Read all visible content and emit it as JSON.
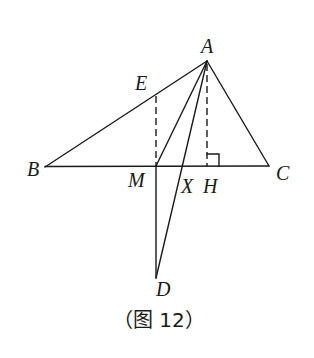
{
  "figure": {
    "caption": "（图 12）",
    "colors": {
      "line": "#1a1a1a",
      "background": "#ffffff"
    },
    "points": {
      "A": {
        "label": "A",
        "x": 207,
        "y": 61
      },
      "B": {
        "label": "B",
        "x": 45,
        "y": 167
      },
      "C": {
        "label": "C",
        "x": 269,
        "y": 166
      },
      "E": {
        "label": "E",
        "x": 156,
        "y": 95
      },
      "M": {
        "label": "M",
        "x": 156,
        "y": 166
      },
      "X": {
        "label": "X",
        "x": 183,
        "y": 166
      },
      "H": {
        "label": "H",
        "x": 207,
        "y": 166
      },
      "D": {
        "label": "D",
        "x": 156,
        "y": 278
      }
    },
    "segments": [
      {
        "from": "A",
        "to": "B",
        "style": "solid"
      },
      {
        "from": "A",
        "to": "C",
        "style": "solid"
      },
      {
        "from": "B",
        "to": "C",
        "style": "solid"
      },
      {
        "from": "A",
        "to": "M",
        "style": "solid"
      },
      {
        "from": "A",
        "to": "D",
        "style": "solid"
      },
      {
        "from": "M",
        "to": "D",
        "style": "solid"
      },
      {
        "from": "E",
        "to": "M",
        "style": "dashed"
      },
      {
        "from": "A",
        "to": "H",
        "style": "dashed"
      }
    ],
    "right_angle_marker": {
      "at": "H",
      "size": 12
    }
  }
}
